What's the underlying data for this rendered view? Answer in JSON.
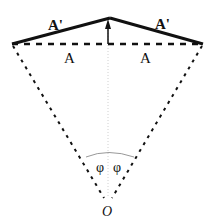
{
  "diagram": {
    "labels": {
      "top_left": "A'",
      "top_right": "A'",
      "bottom_left": "A",
      "bottom_right": "A",
      "angle_left": "φ",
      "angle_right": "φ",
      "origin": "O"
    },
    "colors": {
      "stroke": "#111111",
      "guide": "#cccccc",
      "arc": "#999999"
    }
  }
}
